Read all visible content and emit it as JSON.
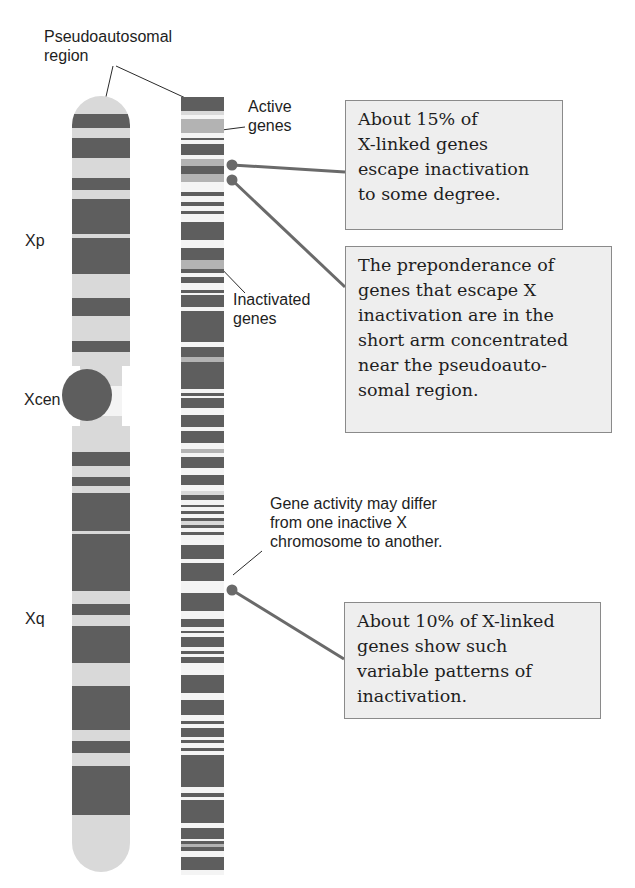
{
  "colors": {
    "dark": "#5e5e5e",
    "light": "#d9d9d9",
    "mid": "#b3b3b3",
    "white": "#f4f4f4",
    "box_bg": "#eeeeee",
    "box_border": "#8a8a8a",
    "leader": "#6a6a6a"
  },
  "labels": {
    "pseudoautosomal": "Pseudoautosomal\nregion",
    "active_genes": "Active\ngenes",
    "inactivated_genes": "Inactivated\ngenes",
    "xp": "Xp",
    "xcen": "Xcen",
    "xq": "Xq",
    "gene_activity": "Gene activity may differ\nfrom one inactive X\nchromosome to another."
  },
  "boxes": [
    {
      "id": "escape-15pct",
      "text": "About 15% of\nX-linked genes\nescape inactivation\nto some degree."
    },
    {
      "id": "short-arm",
      "text": "The preponderance of\ngenes that escape X\ninactivation are in the\nshort arm concentrated\nnear the pseudoauto-\nsomal region."
    },
    {
      "id": "variable-10pct",
      "text": "About 10% of X-linked\ngenes show such\nvariable patterns of\ninactivation."
    }
  ],
  "left_chromosome": {
    "bands": [
      [
        0,
        18,
        "light"
      ],
      [
        18,
        32,
        "dark"
      ],
      [
        32,
        42,
        "light"
      ],
      [
        42,
        62,
        "dark"
      ],
      [
        62,
        82,
        "light"
      ],
      [
        82,
        94,
        "dark"
      ],
      [
        94,
        103,
        "light"
      ],
      [
        103,
        138,
        "dark"
      ],
      [
        138,
        142,
        "light"
      ],
      [
        142,
        178,
        "dark"
      ],
      [
        178,
        202,
        "light"
      ],
      [
        202,
        220,
        "dark"
      ],
      [
        220,
        245,
        "light"
      ],
      [
        245,
        256,
        "dark"
      ],
      [
        256,
        290,
        "light"
      ],
      [
        290,
        320,
        "white"
      ],
      [
        320,
        356,
        "light"
      ],
      [
        356,
        370,
        "dark"
      ],
      [
        370,
        381,
        "light"
      ],
      [
        381,
        390,
        "dark"
      ],
      [
        390,
        397,
        "light"
      ],
      [
        397,
        435,
        "dark"
      ],
      [
        435,
        438,
        "light"
      ],
      [
        438,
        495,
        "dark"
      ],
      [
        495,
        508,
        "light"
      ],
      [
        508,
        519,
        "dark"
      ],
      [
        519,
        530,
        "light"
      ],
      [
        530,
        567,
        "dark"
      ],
      [
        567,
        590,
        "light"
      ],
      [
        590,
        634,
        "dark"
      ],
      [
        634,
        645,
        "light"
      ],
      [
        645,
        657,
        "dark"
      ],
      [
        657,
        670,
        "light"
      ],
      [
        670,
        719,
        "dark"
      ],
      [
        719,
        776,
        "light"
      ]
    ]
  },
  "right_chromosome": {
    "bands": [
      [
        0,
        14,
        "dark"
      ],
      [
        14,
        18,
        "light"
      ],
      [
        18,
        22,
        "white"
      ],
      [
        22,
        36,
        "mid"
      ],
      [
        36,
        41,
        "white"
      ],
      [
        41,
        43,
        "dark"
      ],
      [
        43,
        47,
        "white"
      ],
      [
        47,
        58,
        "dark"
      ],
      [
        58,
        62,
        "white"
      ],
      [
        62,
        69,
        "mid"
      ],
      [
        69,
        77,
        "dark"
      ],
      [
        77,
        85,
        "mid"
      ],
      [
        85,
        89,
        "white"
      ],
      [
        89,
        95,
        "white"
      ],
      [
        95,
        99,
        "dark"
      ],
      [
        99,
        105,
        "white"
      ],
      [
        105,
        109,
        "dark"
      ],
      [
        109,
        114,
        "white"
      ],
      [
        114,
        117,
        "dark"
      ],
      [
        117,
        125,
        "white"
      ],
      [
        125,
        143,
        "dark"
      ],
      [
        143,
        151,
        "white"
      ],
      [
        151,
        163,
        "dark"
      ],
      [
        163,
        172,
        "mid"
      ],
      [
        172,
        176,
        "dark"
      ],
      [
        176,
        180,
        "white"
      ],
      [
        180,
        186,
        "dark"
      ],
      [
        186,
        193,
        "white"
      ],
      [
        193,
        196,
        "dark"
      ],
      [
        196,
        198,
        "white"
      ],
      [
        198,
        210,
        "dark"
      ],
      [
        210,
        214,
        "white"
      ],
      [
        214,
        245,
        "dark"
      ],
      [
        245,
        250,
        "white"
      ],
      [
        250,
        260,
        "dark"
      ],
      [
        260,
        265,
        "mid"
      ],
      [
        265,
        292,
        "dark"
      ],
      [
        292,
        296,
        "white"
      ],
      [
        296,
        299,
        "dark"
      ],
      [
        299,
        301,
        "white"
      ],
      [
        301,
        311,
        "dark"
      ],
      [
        311,
        318,
        "white"
      ],
      [
        318,
        330,
        "dark"
      ],
      [
        330,
        334,
        "white"
      ],
      [
        334,
        346,
        "dark"
      ],
      [
        346,
        352,
        "white"
      ],
      [
        352,
        356,
        "mid"
      ],
      [
        356,
        360,
        "white"
      ],
      [
        360,
        371,
        "dark"
      ],
      [
        371,
        378,
        "white"
      ],
      [
        378,
        388,
        "dark"
      ],
      [
        388,
        394,
        "white"
      ],
      [
        394,
        398,
        "light"
      ],
      [
        398,
        403,
        "dark"
      ],
      [
        403,
        408,
        "white"
      ],
      [
        408,
        410,
        "dark"
      ],
      [
        410,
        414,
        "white"
      ],
      [
        414,
        417,
        "dark"
      ],
      [
        417,
        421,
        "white"
      ],
      [
        421,
        424,
        "dark"
      ],
      [
        424,
        428,
        "light"
      ],
      [
        428,
        431,
        "dark"
      ],
      [
        431,
        435,
        "white"
      ],
      [
        435,
        438,
        "dark"
      ],
      [
        438,
        448,
        "white"
      ],
      [
        448,
        462,
        "dark"
      ],
      [
        462,
        466,
        "white"
      ],
      [
        466,
        484,
        "dark"
      ],
      [
        484,
        496,
        "white"
      ],
      [
        496,
        514,
        "dark"
      ],
      [
        514,
        522,
        "white"
      ],
      [
        522,
        530,
        "dark"
      ],
      [
        530,
        534,
        "white"
      ],
      [
        534,
        536,
        "dark"
      ],
      [
        536,
        540,
        "white"
      ],
      [
        540,
        550,
        "dark"
      ],
      [
        550,
        554,
        "white"
      ],
      [
        554,
        557,
        "dark"
      ],
      [
        557,
        560,
        "white"
      ],
      [
        560,
        566,
        "dark"
      ],
      [
        566,
        578,
        "white"
      ],
      [
        578,
        596,
        "dark"
      ],
      [
        596,
        603,
        "white"
      ],
      [
        603,
        618,
        "dark"
      ],
      [
        618,
        624,
        "white"
      ],
      [
        624,
        627,
        "dark"
      ],
      [
        627,
        631,
        "white"
      ],
      [
        631,
        640,
        "dark"
      ],
      [
        640,
        643,
        "white"
      ],
      [
        643,
        646,
        "dark"
      ],
      [
        646,
        651,
        "white"
      ],
      [
        651,
        654,
        "dark"
      ],
      [
        654,
        658,
        "white"
      ],
      [
        658,
        690,
        "dark"
      ],
      [
        690,
        696,
        "white"
      ],
      [
        696,
        700,
        "dark"
      ],
      [
        700,
        703,
        "white"
      ],
      [
        703,
        726,
        "dark"
      ],
      [
        726,
        731,
        "white"
      ],
      [
        731,
        742,
        "dark"
      ],
      [
        742,
        744,
        "white"
      ],
      [
        744,
        747,
        "dark"
      ],
      [
        747,
        750,
        "mid"
      ],
      [
        750,
        754,
        "dark"
      ],
      [
        754,
        760,
        "white"
      ],
      [
        760,
        773,
        "dark"
      ],
      [
        773,
        778,
        "white"
      ]
    ]
  }
}
